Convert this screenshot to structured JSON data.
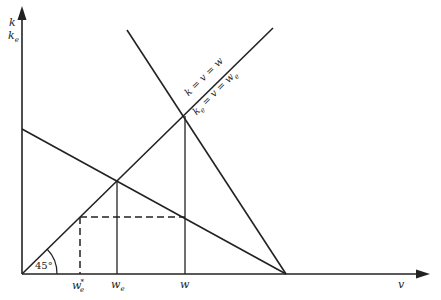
{
  "diagram": {
    "y_axis_label_1": "k",
    "y_axis_label_2": "k",
    "y_axis_label_2_sub": "e",
    "x_axis_label": "v",
    "line_label_1": "k = v = w",
    "line_label_2_base": "k",
    "line_label_2_sub": "e",
    "line_label_2_rest": " = v = w",
    "line_label_2_rest_sub": "e",
    "angle_label": "45°",
    "x_ticks": [
      {
        "base": "w",
        "sub": "e",
        "sup": "*"
      },
      {
        "base": "w",
        "sub": "e",
        "sup": ""
      },
      {
        "base": "w",
        "sub": "",
        "sup": ""
      }
    ],
    "stroke_color": "#222222"
  }
}
